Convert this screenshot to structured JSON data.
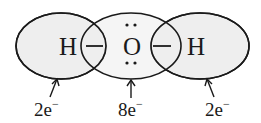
{
  "diagram": {
    "fill_color": "#eeeeee",
    "stroke_color": "#1a1a1a",
    "atoms": [
      {
        "symbol": "H",
        "electrons": "2e",
        "charge": "−"
      },
      {
        "symbol": "O",
        "electrons": "8e",
        "charge": "−",
        "lone_pairs": 2
      },
      {
        "symbol": "H",
        "electrons": "2e",
        "charge": "−"
      }
    ],
    "bonds": [
      {
        "from": 0,
        "to": 1,
        "symbol": "—"
      },
      {
        "from": 1,
        "to": 2,
        "symbol": "—"
      }
    ]
  }
}
